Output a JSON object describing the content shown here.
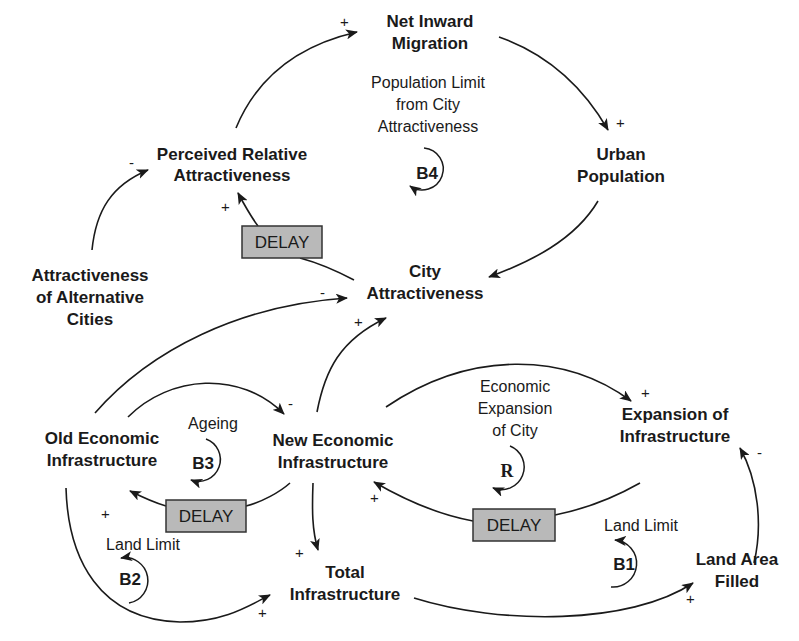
{
  "diagram": {
    "type": "causal-loop-diagram",
    "colors": {
      "ink": "#1a1a1a",
      "delay_fill": "#b9b9b9",
      "delay_border": "#333333",
      "background": "#ffffff"
    },
    "nodes": {
      "net_inward_migration": [
        "Net Inward",
        "Migration"
      ],
      "urban_population": [
        "Urban",
        "Population"
      ],
      "perceived_relative_attractiveness": [
        "Perceived Relative",
        "Attractiveness"
      ],
      "city_attractiveness": [
        "City",
        "Attractiveness"
      ],
      "attractiveness_alternative_cities": [
        "Attractiveness",
        "of Alternative",
        "Cities"
      ],
      "old_economic_infrastructure": [
        "Old Economic",
        "Infrastructure"
      ],
      "new_economic_infrastructure": [
        "New Economic",
        "Infrastructure"
      ],
      "expansion_of_infrastructure": [
        "Expansion of",
        "Infrastructure"
      ],
      "total_infrastructure": [
        "Total",
        "Infrastructure"
      ],
      "land_area_filled": [
        "Land Area",
        "Filled"
      ]
    },
    "loops": {
      "b4": {
        "id": "B4",
        "label": [
          "Population Limit",
          "from City",
          "Attractiveness"
        ]
      },
      "b3": {
        "id": "B3",
        "label": [
          "Ageing"
        ]
      },
      "b2": {
        "id": "B2",
        "label": [
          "Land Limit"
        ]
      },
      "r": {
        "id": "R",
        "label": [
          "Economic",
          "Expansion",
          "of City"
        ]
      },
      "b1": {
        "id": "B1",
        "label": [
          "Land Limit"
        ]
      }
    },
    "delay_label": "DELAY",
    "links": [
      {
        "from": "Perceived Relative Attractiveness",
        "to": "Net Inward Migration",
        "polarity": "+"
      },
      {
        "from": "Net Inward Migration",
        "to": "Urban Population",
        "polarity": "+"
      },
      {
        "from": "Urban Population",
        "to": "City Attractiveness",
        "polarity": ""
      },
      {
        "from": "City Attractiveness",
        "to": "Perceived Relative Attractiveness",
        "polarity": "+",
        "delay": true
      },
      {
        "from": "Attractiveness of Alternative Cities",
        "to": "Perceived Relative Attractiveness",
        "polarity": "-"
      },
      {
        "from": "Old Economic Infrastructure",
        "to": "City Attractiveness",
        "polarity": "-"
      },
      {
        "from": "New Economic Infrastructure",
        "to": "City Attractiveness",
        "polarity": "+"
      },
      {
        "from": "Old Economic Infrastructure",
        "to": "New Economic Infrastructure",
        "polarity": "-"
      },
      {
        "from": "New Economic Infrastructure",
        "to": "Old Economic Infrastructure",
        "polarity": "+",
        "delay": true
      },
      {
        "from": "New Economic Infrastructure",
        "to": "Expansion of Infrastructure",
        "polarity": "+"
      },
      {
        "from": "Expansion of Infrastructure",
        "to": "New Economic Infrastructure",
        "polarity": "+",
        "delay": true
      },
      {
        "from": "New Economic Infrastructure",
        "to": "Total Infrastructure",
        "polarity": "+"
      },
      {
        "from": "Old Economic Infrastructure",
        "to": "Total Infrastructure",
        "polarity": "+"
      },
      {
        "from": "Total Infrastructure",
        "to": "Land Area Filled",
        "polarity": "+"
      },
      {
        "from": "Land Area Filled",
        "to": "Expansion of Infrastructure",
        "polarity": "-"
      }
    ],
    "polarity_marks": {
      "plus": "+",
      "minus": "-"
    }
  }
}
